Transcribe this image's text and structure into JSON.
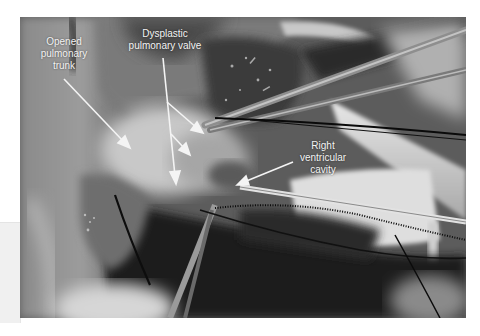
{
  "figure": {
    "labels": [
      {
        "id": "trunk",
        "lines": [
          "Opened",
          "pulmonary",
          "trunk"
        ]
      },
      {
        "id": "valve",
        "lines": [
          "Dysplastic",
          "pulmonary valve"
        ]
      },
      {
        "id": "rv",
        "lines": [
          "Right",
          "ventricular",
          "cavity"
        ]
      }
    ],
    "arrows": [
      {
        "label": "trunk",
        "from": [
          64,
          79
        ],
        "to": [
          130,
          148
        ]
      },
      {
        "label": "valve",
        "from": [
          163,
          58
        ],
        "to": [
          176,
          184
        ]
      },
      {
        "label": "valve",
        "from": [
          167,
          102
        ],
        "to": [
          203,
          133
        ]
      },
      {
        "label": "valve",
        "from": [
          171,
          134
        ],
        "to": [
          190,
          155
        ]
      },
      {
        "label": "rv",
        "from": [
          293,
          162
        ],
        "to": [
          237,
          185
        ]
      }
    ],
    "colors": {
      "annotation": "#f4f4f4",
      "background": "#ffffff"
    }
  }
}
